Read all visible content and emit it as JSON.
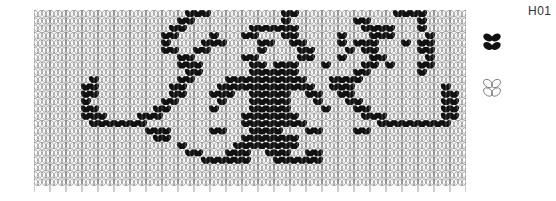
{
  "chart_code": "H01",
  "grid": {
    "cols": 54,
    "rows": 24,
    "cell_width": 8,
    "cell_height": 7.33,
    "filled_color": "#111111",
    "line_color": "#555555",
    "pattern": [
      "000000000000000000011100000000011000000000000111100000",
      "000000000000000000110000000000010000000011000000100000",
      "0000000000000000011000000001111110000000011110001000000",
      "000000000000000011000010001100011000001000111000010000",
      "000000000000000010000111000011001100001011100010110000",
      "000000000000000011001100000010000110000101100000110000",
      "000000000000000000110000001100000110001000110000010000",
      "000000000000000000111000000110111000100001101000110000",
      "000000000000000000011000000111111000000011000000100000",
      "000000010000000000110000111111111100011110000000000000",
      "000000110000000001100001111111111110011100000000000100",
      "000000110000000001100011100111110011001100000000000110",
      "000000100000000011000001000111110001000110000000000110",
      "000000110000000110000010000111110000100011000000000110",
      "000000111000011100000000001111111000000001110000000110",
      "000000011111110000000000001111111100000000011111111100",
      "000000000000001110000011000111100011000011000000000000",
      "000000000000000110000000001111111000000000000000000000",
      "000000000000000000100000011111111000000000000000000000",
      "000000000000000000011000111001110011000000000000000000",
      "000000000000000000000111111000111111000000000000000000",
      "000000000000000000000000000000000000000000000000000000",
      "000000000000000000000000000000000000000000000000000000",
      "000000000000000000000000000000000000000000000000000000"
    ]
  },
  "legend": [
    {
      "name": "contrast-color-stitch",
      "style": "filled",
      "color": "#111111"
    },
    {
      "name": "main-color-stitch",
      "style": "outline",
      "color": "#777777"
    }
  ]
}
